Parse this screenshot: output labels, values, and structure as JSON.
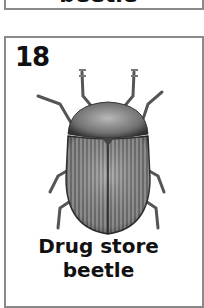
{
  "previous_card": {
    "name_tail": "beetle"
  },
  "card": {
    "number": "18",
    "name_line1": "Drug store",
    "name_line2": "beetle",
    "illustration": "drug-store-beetle-illustration"
  },
  "colors": {
    "border": "#8a8a8a",
    "text": "#111111",
    "background": "#ffffff"
  }
}
